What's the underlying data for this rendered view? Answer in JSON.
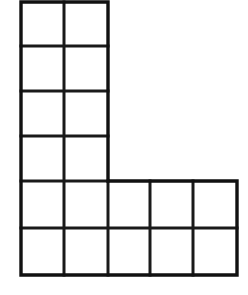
{
  "figure": {
    "shape_name": "L-shape",
    "background_color": "#ffffff",
    "line_color": "#1a1a1a",
    "outline_color": "#111111",
    "fill_color": "#ffffff",
    "line_width_px": 3,
    "total_cells": 18,
    "cell_width_px": 43,
    "cell_height_px": 45
  },
  "chart_data": {
    "type": "table",
    "xlabel": "",
    "ylabel": "",
    "columns": 5,
    "rows": 6,
    "cell_size": {
      "width": 43,
      "height": 45
    },
    "x_gridlines": [
      21,
      64,
      108,
      150,
      193,
      237
    ],
    "y_gridlines": [
      2,
      46,
      91,
      136,
      181,
      228,
      275
    ],
    "occupancy": [
      [
        1,
        1,
        0,
        0,
        0
      ],
      [
        1,
        1,
        0,
        0,
        0
      ],
      [
        1,
        1,
        0,
        0,
        0
      ],
      [
        1,
        1,
        0,
        0,
        0
      ],
      [
        1,
        1,
        1,
        1,
        1
      ],
      [
        1,
        1,
        1,
        1,
        1
      ]
    ],
    "regions": [
      {
        "name": "vertical-arm",
        "columns": 2,
        "rows": 4,
        "cells": 8,
        "x_start": 21,
        "x_end": 108,
        "y_start": 2,
        "y_end": 181
      },
      {
        "name": "horizontal-arm",
        "columns": 5,
        "rows": 2,
        "cells": 10,
        "x_start": 21,
        "x_end": 237,
        "y_start": 181,
        "y_end": 275
      }
    ],
    "outline_path": "M 21 2 L 108 2 L 108 181 L 237 181 L 237 275 L 21 275 Z",
    "interior_vertical_segments": [
      {
        "x": 64,
        "y1": 2,
        "y2": 275
      },
      {
        "x": 108,
        "y1": 181,
        "y2": 275
      },
      {
        "x": 150,
        "y1": 181,
        "y2": 275
      },
      {
        "x": 193,
        "y1": 181,
        "y2": 275
      }
    ],
    "interior_horizontal_segments": [
      {
        "y": 46,
        "x1": 21,
        "x2": 108
      },
      {
        "y": 91,
        "x1": 21,
        "x2": 108
      },
      {
        "y": 136,
        "x1": 21,
        "x2": 108
      },
      {
        "y": 181,
        "x1": 21,
        "x2": 108
      },
      {
        "y": 228,
        "x1": 21,
        "x2": 237
      }
    ],
    "grid": true,
    "legend": null,
    "annotations": []
  }
}
